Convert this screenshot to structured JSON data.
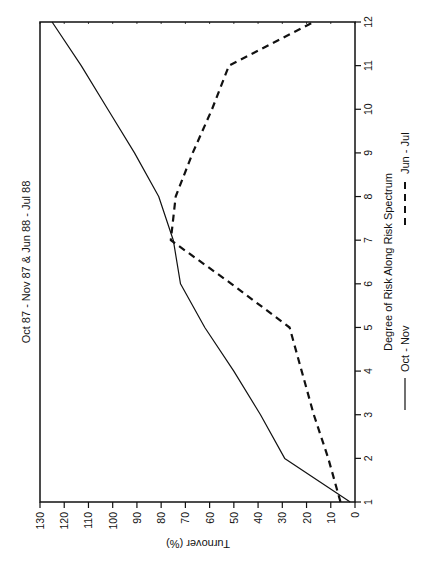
{
  "chart_data": {
    "type": "line",
    "orientation": "rotated-90-clockwise",
    "title": "Oct 87 - Nov 87 & Jun 88 - Jul 88",
    "xlabel": "Degree of Risk Along Risk Spectrum",
    "ylabel": "Turnover (%)",
    "x": [
      1,
      2,
      3,
      4,
      5,
      6,
      7,
      8,
      9,
      10,
      11,
      12
    ],
    "xlim": [
      1,
      12
    ],
    "ylim": [
      0,
      130
    ],
    "x_ticks": [
      "1",
      "2",
      "3",
      "4",
      "5",
      "6",
      "7",
      "8",
      "9",
      "10",
      "11",
      "12"
    ],
    "y_ticks": [
      "0",
      "10",
      "20",
      "30",
      "40",
      "50",
      "60",
      "70",
      "80",
      "90",
      "100",
      "110",
      "120",
      "130"
    ],
    "grid": false,
    "legend_position": "bottom (right side of rotated page)",
    "series": [
      {
        "name": "Oct - Nov",
        "style": "solid",
        "points": [
          [
            1,
            2
          ],
          [
            2,
            29
          ],
          [
            3,
            39
          ],
          [
            4,
            50
          ],
          [
            5,
            62
          ],
          [
            6,
            72
          ],
          [
            7,
            75
          ],
          [
            8,
            81
          ],
          [
            9,
            91
          ],
          [
            10,
            102
          ],
          [
            11,
            113
          ],
          [
            12,
            125
          ]
        ]
      },
      {
        "name": "Jun - Jul",
        "style": "dashed",
        "points": [
          [
            1,
            6
          ],
          [
            2,
            11
          ],
          [
            3,
            17
          ],
          [
            4,
            22
          ],
          [
            5,
            27
          ],
          [
            6,
            51
          ],
          [
            7,
            76
          ],
          [
            8,
            74
          ],
          [
            9,
            67
          ],
          [
            10,
            59
          ],
          [
            11,
            52
          ],
          [
            12,
            17
          ]
        ]
      }
    ]
  },
  "labels": {
    "title": "Oct 87 - Nov 87 & Jun 88 - Jul 88",
    "xlabel": "Degree of Risk Along Risk Spectrum",
    "ylabel": "Turnover (%)",
    "legend_solid": "Oct - Nov",
    "legend_dashed": "Jun - Jul"
  }
}
